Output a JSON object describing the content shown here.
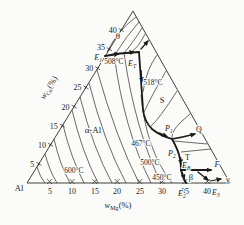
{
  "figure": {
    "background": "#fbfbfa",
    "line_color": "#1a1a1a",
    "corner_label": "Al",
    "axes": {
      "left": {
        "label_base": "w",
        "label_sub": "Cu",
        "label_unit": "(%)",
        "ticks": [
          "5",
          "10",
          "15",
          "20",
          "25",
          "30",
          "35",
          "40"
        ]
      },
      "bottom": {
        "label_base": "w",
        "label_sub": "Mg",
        "label_unit": "(%)",
        "ticks": [
          "5",
          "10",
          "15",
          "20",
          "25",
          "30",
          "35",
          "40"
        ]
      }
    },
    "regions": {
      "alpha": "α-Al",
      "theta": "θ",
      "s_phase": "S",
      "t_phase": "T",
      "beta": "β",
      "gamma": "γ"
    },
    "isotherms": {
      "t600": "600°C",
      "t508": "508°C",
      "t518": "518°C",
      "t500": "500°C",
      "t467": "467°C",
      "t450": "450°C"
    },
    "points": {
      "e1": {
        "base": "E",
        "sub": "1"
      },
      "et": {
        "base": "E",
        "sub": "T"
      },
      "p1": {
        "base": "P",
        "sub": "1"
      },
      "p2": {
        "base": "P",
        "sub": "2"
      },
      "eb": {
        "base": "E",
        "sub": "B"
      },
      "e2": {
        "base": "E",
        "sub": "2"
      },
      "e3": {
        "base": "E",
        "sub": "3"
      },
      "q": "Q",
      "f": "F"
    }
  }
}
